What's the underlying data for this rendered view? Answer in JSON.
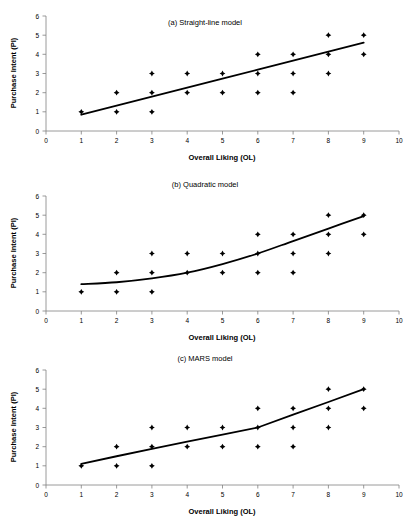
{
  "figure": {
    "panels": [
      {
        "id": "panel-a",
        "title": "(a) Straight-line model",
        "fit_type": "line"
      },
      {
        "id": "panel-b",
        "title": "(b) Quadratic model",
        "fit_type": "quadratic"
      },
      {
        "id": "panel-c",
        "title": "(c) MARS model",
        "fit_type": "piecewise-linear"
      }
    ]
  },
  "chart_data": [
    {
      "type": "scatter",
      "title": "(a) Straight-line model",
      "xlabel": "Overall Liking (OL)",
      "ylabel": "Purchase Intent (PI)",
      "xlim": [
        0,
        10
      ],
      "ylim": [
        0,
        6
      ],
      "xticks": [
        0,
        1,
        2,
        3,
        4,
        5,
        6,
        7,
        8,
        9,
        10
      ],
      "yticks": [
        0,
        1,
        2,
        3,
        4,
        5,
        6
      ],
      "grid": false,
      "legend": "none",
      "marker": "diamond",
      "marker_color": "#000000",
      "line_color": "#000000",
      "points": [
        {
          "x": 1,
          "y": 1
        },
        {
          "x": 2,
          "y": 1
        },
        {
          "x": 2,
          "y": 2
        },
        {
          "x": 3,
          "y": 1
        },
        {
          "x": 3,
          "y": 2
        },
        {
          "x": 3,
          "y": 3
        },
        {
          "x": 4,
          "y": 2
        },
        {
          "x": 4,
          "y": 3
        },
        {
          "x": 5,
          "y": 2
        },
        {
          "x": 5,
          "y": 3
        },
        {
          "x": 6,
          "y": 2
        },
        {
          "x": 6,
          "y": 3
        },
        {
          "x": 6,
          "y": 4
        },
        {
          "x": 7,
          "y": 2
        },
        {
          "x": 7,
          "y": 3
        },
        {
          "x": 7,
          "y": 4
        },
        {
          "x": 8,
          "y": 3
        },
        {
          "x": 8,
          "y": 4
        },
        {
          "x": 8,
          "y": 5
        },
        {
          "x": 9,
          "y": 4
        },
        {
          "x": 9,
          "y": 5
        }
      ],
      "fit": {
        "kind": "line",
        "label": "straight-line fit",
        "x": [
          1,
          2,
          3,
          4,
          5,
          6,
          7,
          8,
          9
        ],
        "y": [
          0.85,
          1.32,
          1.79,
          2.26,
          2.73,
          3.2,
          3.67,
          4.14,
          4.61
        ]
      }
    },
    {
      "type": "scatter",
      "title": "(b) Quadratic model",
      "xlabel": "Overall Liking (OL)",
      "ylabel": "Purchase Intent (PI)",
      "xlim": [
        0,
        10
      ],
      "ylim": [
        0,
        6
      ],
      "xticks": [
        0,
        1,
        2,
        3,
        4,
        5,
        6,
        7,
        8,
        9,
        10
      ],
      "yticks": [
        0,
        1,
        2,
        3,
        4,
        5,
        6
      ],
      "grid": false,
      "legend": "none",
      "marker": "diamond",
      "marker_color": "#000000",
      "line_color": "#000000",
      "points": [
        {
          "x": 1,
          "y": 1
        },
        {
          "x": 2,
          "y": 1
        },
        {
          "x": 2,
          "y": 2
        },
        {
          "x": 3,
          "y": 1
        },
        {
          "x": 3,
          "y": 2
        },
        {
          "x": 3,
          "y": 3
        },
        {
          "x": 4,
          "y": 2
        },
        {
          "x": 4,
          "y": 3
        },
        {
          "x": 5,
          "y": 2
        },
        {
          "x": 5,
          "y": 3
        },
        {
          "x": 6,
          "y": 2
        },
        {
          "x": 6,
          "y": 3
        },
        {
          "x": 6,
          "y": 4
        },
        {
          "x": 7,
          "y": 2
        },
        {
          "x": 7,
          "y": 3
        },
        {
          "x": 7,
          "y": 4
        },
        {
          "x": 8,
          "y": 3
        },
        {
          "x": 8,
          "y": 4
        },
        {
          "x": 8,
          "y": 5
        },
        {
          "x": 9,
          "y": 4
        },
        {
          "x": 9,
          "y": 5
        }
      ],
      "fit": {
        "kind": "quadratic",
        "label": "quadratic fit",
        "x": [
          1,
          2,
          3,
          4,
          5,
          6,
          7,
          8,
          9
        ],
        "y": [
          1.4,
          1.5,
          1.7,
          2.0,
          2.45,
          3.0,
          3.65,
          4.3,
          4.95
        ]
      }
    },
    {
      "type": "scatter",
      "title": "(c) MARS model",
      "xlabel": "Overall Liking (OL)",
      "ylabel": "Purchase Intent (PI)",
      "xlim": [
        0,
        10
      ],
      "ylim": [
        0,
        6
      ],
      "xticks": [
        0,
        1,
        2,
        3,
        4,
        5,
        6,
        7,
        8,
        9,
        10
      ],
      "yticks": [
        0,
        1,
        2,
        3,
        4,
        5,
        6
      ],
      "grid": false,
      "legend": "none",
      "marker": "diamond",
      "marker_color": "#000000",
      "line_color": "#000000",
      "points": [
        {
          "x": 1,
          "y": 1
        },
        {
          "x": 2,
          "y": 1
        },
        {
          "x": 2,
          "y": 2
        },
        {
          "x": 3,
          "y": 1
        },
        {
          "x": 3,
          "y": 2
        },
        {
          "x": 3,
          "y": 3
        },
        {
          "x": 4,
          "y": 2
        },
        {
          "x": 4,
          "y": 3
        },
        {
          "x": 5,
          "y": 2
        },
        {
          "x": 5,
          "y": 3
        },
        {
          "x": 6,
          "y": 2
        },
        {
          "x": 6,
          "y": 3
        },
        {
          "x": 6,
          "y": 4
        },
        {
          "x": 7,
          "y": 2
        },
        {
          "x": 7,
          "y": 3
        },
        {
          "x": 7,
          "y": 4
        },
        {
          "x": 8,
          "y": 3
        },
        {
          "x": 8,
          "y": 4
        },
        {
          "x": 8,
          "y": 5
        },
        {
          "x": 9,
          "y": 4
        },
        {
          "x": 9,
          "y": 5
        }
      ],
      "fit": {
        "kind": "piecewise-linear",
        "label": "MARS fit",
        "knots": [
          6
        ],
        "x": [
          1,
          2,
          3,
          4,
          5,
          6,
          7,
          8,
          9
        ],
        "y": [
          1.1,
          1.5,
          1.88,
          2.26,
          2.63,
          3.0,
          3.67,
          4.33,
          5.0
        ]
      }
    }
  ]
}
